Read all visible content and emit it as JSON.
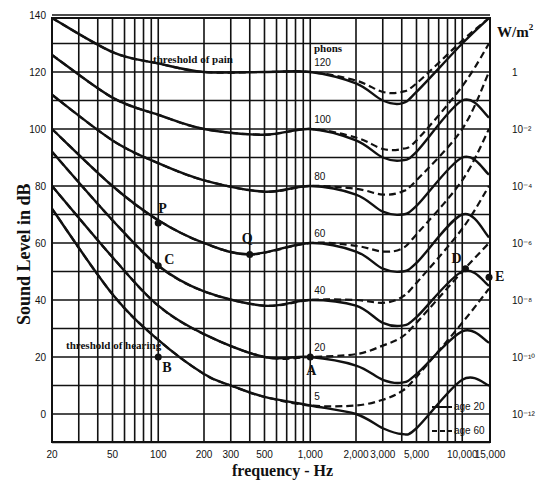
{
  "chart_data": {
    "type": "line",
    "xlabel": "frequency - Hz",
    "ylabel": "Sound Level in dB",
    "y2label": "W/m²",
    "xscale": "log",
    "xlim": [
      20,
      15000
    ],
    "ylim": [
      -10,
      140
    ],
    "grid": true,
    "x_ticks": [
      "20",
      "50",
      "100",
      "200",
      "300",
      "500",
      "1,000",
      "2,000",
      "3,000",
      "5,000",
      "10,000",
      "15,000"
    ],
    "x_tick_values": [
      20,
      50,
      100,
      200,
      300,
      500,
      1000,
      2000,
      3000,
      5000,
      10000,
      15000
    ],
    "y_ticks": [
      "0",
      "20",
      "40",
      "60",
      "80",
      "100",
      "120",
      "140"
    ],
    "y2_ticks": [
      {
        "label": "1",
        "db": 120
      },
      {
        "label": "10⁻²",
        "db": 100
      },
      {
        "label": "10⁻⁴",
        "db": 80
      },
      {
        "label": "10⁻⁶",
        "db": 60
      },
      {
        "label": "10⁻⁸",
        "db": 40
      },
      {
        "label": "10⁻¹⁰",
        "db": 20
      },
      {
        "label": "10⁻¹²",
        "db": 0
      }
    ],
    "curve_labels_header": "phons",
    "series": [
      {
        "name": "120 phons (threshold of pain)",
        "phon": 120,
        "x": [
          20,
          50,
          100,
          200,
          500,
          1000,
          2000,
          3000,
          4000,
          5000,
          10000,
          15000
        ],
        "age20": [
          140,
          127,
          123,
          120,
          120,
          120,
          116,
          110,
          109,
          113,
          130,
          140
        ],
        "age60": [
          140,
          127,
          123,
          120,
          120,
          120,
          117,
          113,
          113,
          116,
          131,
          140
        ]
      },
      {
        "name": "100 phons",
        "phon": 100,
        "x": [
          20,
          50,
          100,
          200,
          500,
          1000,
          2000,
          3000,
          4000,
          5000,
          10000,
          15000
        ],
        "age20": [
          126,
          111,
          105,
          100,
          98,
          100,
          96,
          90,
          89,
          92,
          110,
          104
        ],
        "age60": [
          126,
          111,
          105,
          100,
          98,
          100,
          97,
          93,
          93,
          96,
          115,
          130
        ]
      },
      {
        "name": "80 phons",
        "phon": 80,
        "x": [
          20,
          50,
          100,
          200,
          500,
          1000,
          2000,
          3000,
          4000,
          5000,
          10000,
          15000
        ],
        "age20": [
          112,
          96,
          88,
          82,
          78,
          80,
          77,
          71,
          70,
          73,
          90,
          84
        ],
        "age60": [
          112,
          96,
          88,
          82,
          78,
          80,
          79,
          77,
          78,
          82,
          100,
          120
        ]
      },
      {
        "name": "60 phons",
        "phon": 60,
        "x": [
          20,
          50,
          100,
          200,
          400,
          1000,
          2000,
          3000,
          4000,
          5000,
          10000,
          15000
        ],
        "age20": [
          100,
          80,
          68,
          60,
          56,
          60,
          57,
          51,
          50,
          53,
          70,
          62
        ],
        "age60": [
          100,
          80,
          68,
          60,
          56,
          60,
          59,
          57,
          58,
          63,
          82,
          100
        ]
      },
      {
        "name": "40 phons",
        "phon": 40,
        "x": [
          20,
          50,
          100,
          200,
          500,
          1000,
          2000,
          3000,
          4000,
          5000,
          10000,
          15000
        ],
        "age20": [
          92,
          68,
          52,
          43,
          38,
          40,
          38,
          32,
          31,
          34,
          50,
          45
        ],
        "age60": [
          92,
          68,
          52,
          43,
          38,
          40,
          40,
          39,
          41,
          46,
          65,
          80
        ]
      },
      {
        "name": "20 phons",
        "phon": 20,
        "x": [
          20,
          50,
          100,
          200,
          500,
          1000,
          2000,
          3000,
          4000,
          5000,
          10000,
          15000
        ],
        "age20": [
          80,
          55,
          38,
          28,
          20,
          20,
          17,
          12,
          11,
          14,
          29,
          25
        ],
        "age60": [
          80,
          55,
          38,
          28,
          20,
          20,
          21,
          24,
          27,
          32,
          50,
          60
        ]
      },
      {
        "name": "threshold of hearing (0 phons)",
        "phon": 0,
        "x": [
          20,
          50,
          100,
          200,
          300,
          500,
          1000,
          2000,
          3000,
          4000,
          5000,
          10000,
          15000
        ],
        "age20": [
          72,
          42,
          26,
          14,
          10,
          6,
          3,
          0,
          -5,
          -7,
          -5,
          12,
          10
        ],
        "age60": [
          72,
          42,
          26,
          14,
          10,
          6,
          3,
          3,
          5,
          8,
          13,
          32,
          44
        ]
      }
    ],
    "points": [
      {
        "label": "P",
        "x": 100,
        "y": 67
      },
      {
        "label": "Q",
        "x": 400,
        "y": 56
      },
      {
        "label": "C",
        "x": 100,
        "y": 52
      },
      {
        "label": "B",
        "x": 100,
        "y": 20
      },
      {
        "label": "A",
        "x": 1000,
        "y": 20
      },
      {
        "label": "D",
        "x": 10500,
        "y": 51
      },
      {
        "label": "E",
        "x": 15000,
        "y": 48
      }
    ],
    "annotations": [
      "threshold of pain",
      "threshold of hearing",
      "phons"
    ],
    "legend": {
      "position": "bottom-right",
      "entries": [
        {
          "label": "age 20",
          "style": "solid"
        },
        {
          "label": "age 60",
          "style": "dashed"
        }
      ]
    }
  },
  "labels": {
    "ylabel": "Sound Level in dB",
    "xlabel": "frequency - Hz",
    "y2label": "W/m",
    "y2label_sup": "2",
    "phons": "phons",
    "pain": "threshold of pain",
    "hearing": "threshold of hearing",
    "legend_age20": "age 20",
    "legend_age60": "age 60"
  }
}
